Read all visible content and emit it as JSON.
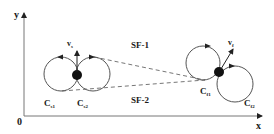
{
  "diagram": {
    "axes": {
      "x_label": "x",
      "y_label": "y",
      "origin_label": "0"
    },
    "start": {
      "circle_left": {
        "label": "C",
        "sub": "s1"
      },
      "circle_right": {
        "label": "C",
        "sub": "s2"
      },
      "velocity": {
        "label": "v",
        "sub": "s"
      }
    },
    "final": {
      "circle_left": {
        "label": "C",
        "sub": "f1"
      },
      "circle_right": {
        "label": "C",
        "sub": "f2"
      },
      "velocity": {
        "label": "v",
        "sub": "f"
      }
    },
    "paths": {
      "upper": "SF-1",
      "lower": "SF-2"
    },
    "colors": {
      "line": "#555555",
      "dot": "#111111",
      "text": "#1a1a1a"
    }
  }
}
